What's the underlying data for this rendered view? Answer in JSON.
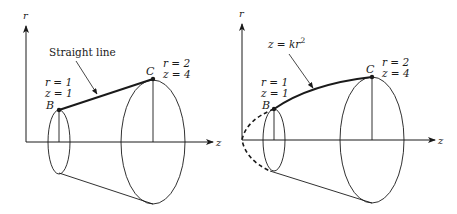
{
  "figure": {
    "colors": {
      "ink": "#1a1a1a",
      "background": "#ffffff"
    },
    "panels": [
      {
        "id": "left",
        "axes": {
          "vertical": "r",
          "horizontal": "z"
        },
        "curve_label": "Straight line",
        "curve_type": "straight",
        "point_B": {
          "name": "B",
          "r_label": "r = 1",
          "z_label": "z = 1"
        },
        "point_C": {
          "name": "C",
          "r_label": "r = 2",
          "z_label": "z = 4"
        }
      },
      {
        "id": "right",
        "axes": {
          "vertical": "r",
          "horizontal": "z"
        },
        "curve_label": "z = kr",
        "curve_label_exponent": "2",
        "curve_type": "parabola",
        "point_B": {
          "name": "B",
          "r_label": "r = 1",
          "z_label": "z = 1"
        },
        "point_C": {
          "name": "C",
          "r_label": "r = 2",
          "z_label": "z = 4"
        }
      }
    ]
  }
}
